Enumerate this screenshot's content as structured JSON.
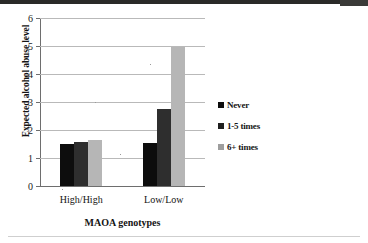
{
  "chart_data": {
    "type": "bar",
    "title": "",
    "xlabel": "MAOA genotypes",
    "ylabel": "Expected alcohol abuse level",
    "categories": [
      "High/High",
      "Low/Low"
    ],
    "series": [
      {
        "name": "Never",
        "values": [
          1.5,
          1.55
        ],
        "color": "#0d0d0d"
      },
      {
        "name": "1-5 times",
        "values": [
          1.58,
          2.75
        ],
        "color": "#2e2e2e"
      },
      {
        "name": "6+ times",
        "values": [
          1.65,
          4.95
        ],
        "color": "#b6b6b6"
      }
    ],
    "ylim": [
      0,
      6
    ],
    "yticks": [
      0,
      1,
      2,
      3,
      4,
      5,
      6
    ],
    "ytick_labels": [
      "0",
      "1",
      "2",
      "3",
      "4",
      "5",
      "6"
    ],
    "grid": true,
    "legend_position": "right"
  },
  "axes": {
    "y_title": "Expected alcohol abuse level",
    "x_title": "MAOA genotypes",
    "y_ticks": [
      "0",
      "1",
      "2",
      "3",
      "4",
      "5",
      "6"
    ],
    "x_categories": [
      "High/High",
      "Low/Low"
    ]
  },
  "legend": {
    "items": [
      {
        "label": "Never",
        "marker": "square-marker"
      },
      {
        "label": "1-5 times",
        "marker": "square-marker"
      },
      {
        "label": "6+ times",
        "marker": "square-marker"
      }
    ]
  }
}
